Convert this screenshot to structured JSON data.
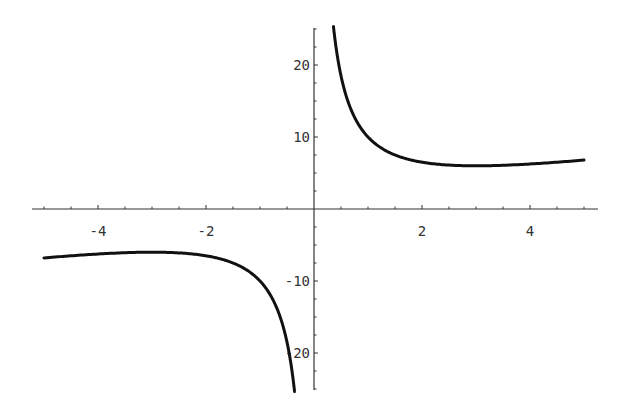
{
  "chart_data": {
    "type": "line",
    "title": "",
    "xlabel": "",
    "ylabel": "",
    "function": "y = x + 9/x",
    "xlim": [
      -5,
      5
    ],
    "ylim": [
      -25,
      25
    ],
    "grid": false,
    "legend": null,
    "x_ticks": [
      {
        "value": -4,
        "label": "-4"
      },
      {
        "value": -2,
        "label": "-2"
      },
      {
        "value": 2,
        "label": "2"
      },
      {
        "value": 4,
        "label": "4"
      }
    ],
    "y_ticks": [
      {
        "value": 20,
        "label": "20"
      },
      {
        "value": 10,
        "label": "10"
      },
      {
        "value": -10,
        "label": "-10"
      },
      {
        "value": -20,
        "label": "-20"
      }
    ],
    "series": [
      {
        "name": "right branch",
        "x": [
          0.36,
          0.4,
          0.5,
          0.6,
          0.75,
          1,
          1.25,
          1.5,
          2,
          2.5,
          3,
          3.5,
          4,
          4.5,
          5
        ],
        "y": [
          25.36,
          22.9,
          18.5,
          15.6,
          12.75,
          10,
          8.45,
          7.5,
          6.5,
          6.1,
          6,
          6.07,
          6.25,
          6.5,
          6.8
        ]
      },
      {
        "name": "left branch",
        "x": [
          -5,
          -4.5,
          -4,
          -3.5,
          -3,
          -2.5,
          -2,
          -1.5,
          -1.25,
          -1,
          -0.75,
          -0.6,
          -0.5,
          -0.4,
          -0.36
        ],
        "y": [
          -6.8,
          -6.5,
          -6.25,
          -6.07,
          -6,
          -6.1,
          -6.5,
          -7.5,
          -8.45,
          -10,
          -12.75,
          -15.6,
          -18.5,
          -22.9,
          -25.36
        ]
      }
    ],
    "colors": {
      "curve": "#111111",
      "axis": "#333333"
    }
  }
}
